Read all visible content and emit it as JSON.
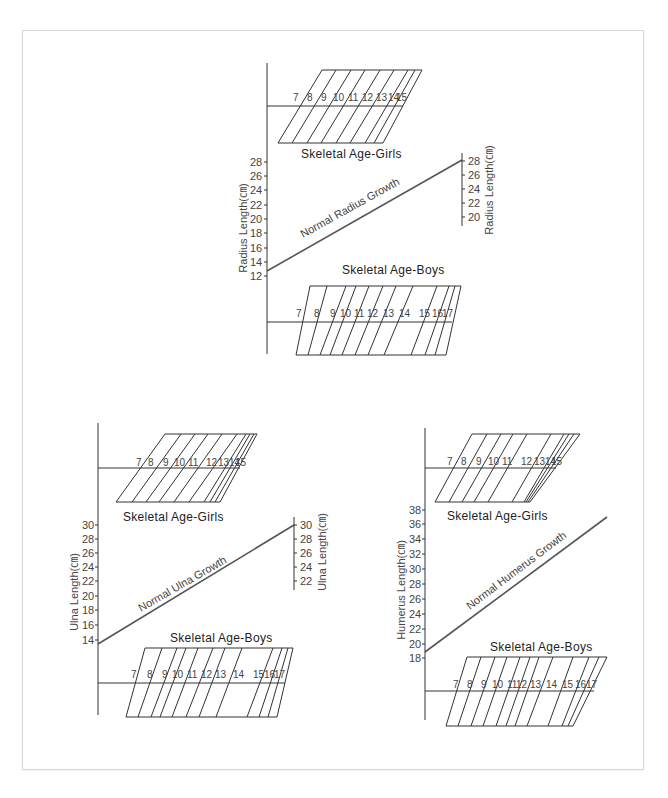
{
  "diagrams": [
    {
      "id": "radius",
      "girls_title": "Skeletal Age-Girls",
      "boys_title": "Skeletal Age-Boys",
      "growth_label": "Normal Radius Growth",
      "left_axis_label": "Radius Length(㎝)",
      "right_axis_label": "Radius Length(㎝)",
      "left_ticks": [
        "28",
        "26",
        "24",
        "22",
        "20",
        "18",
        "16",
        "14",
        "12"
      ],
      "right_ticks": [
        "28",
        "26",
        "24",
        "22",
        "20"
      ],
      "girls_ages": [
        "7",
        "8",
        "9",
        "10",
        "11",
        "12",
        "13",
        "14",
        "15"
      ],
      "boys_ages": [
        "7",
        "8",
        "9",
        "10",
        "11",
        "12",
        "13",
        "14",
        "15",
        "16",
        "17"
      ]
    },
    {
      "id": "ulna",
      "girls_title": "Skeletal Age-Girls",
      "boys_title": "Skeletal Age-Boys",
      "growth_label": "Normal Ulna Growth",
      "left_axis_label": "Ulna Length(㎝)",
      "right_axis_label": "Ulna Length(㎝)",
      "left_ticks": [
        "30",
        "28",
        "26",
        "24",
        "22",
        "20",
        "18",
        "16",
        "14"
      ],
      "right_ticks": [
        "30",
        "28",
        "26",
        "24",
        "22"
      ],
      "girls_ages": [
        "7",
        "8",
        "9",
        "10",
        "11",
        "12",
        "13",
        "14",
        "15"
      ],
      "boys_ages": [
        "7",
        "8",
        "9",
        "10",
        "11",
        "12",
        "13",
        "14",
        "15",
        "16",
        "17"
      ]
    },
    {
      "id": "humerus",
      "girls_title": "Skeletal Age-Girls",
      "boys_title": "Skeletal Age-Boys",
      "growth_label": "Normal Humerus Growth",
      "left_axis_label": "Humerus Length(㎝)",
      "left_ticks": [
        "38",
        "36",
        "34",
        "32",
        "30",
        "28",
        "26",
        "24",
        "22",
        "20",
        "18"
      ],
      "girls_ages": [
        "7",
        "8",
        "9",
        "10",
        "11",
        "12",
        "13",
        "14",
        "15"
      ],
      "boys_ages": [
        "7",
        "8",
        "9",
        "10",
        "11",
        "12",
        "13",
        "14",
        "15",
        "16",
        "17"
      ]
    }
  ],
  "colors": {
    "line": "#333333",
    "growth_line": "#555555",
    "text": "#444444",
    "border": "#d8d8d8"
  }
}
